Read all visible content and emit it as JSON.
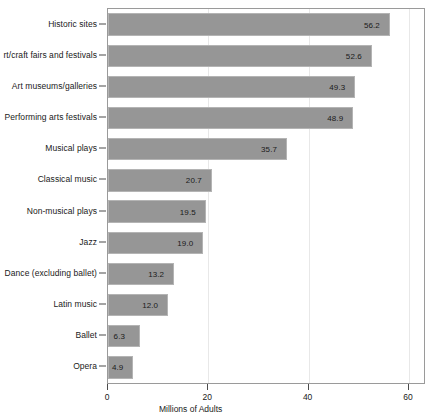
{
  "chart_data": {
    "type": "bar",
    "orientation": "horizontal",
    "title": "",
    "xlabel": "Millions of Adults",
    "ylabel": "",
    "xlim": [
      0,
      63
    ],
    "xticks": [
      0,
      20,
      40,
      60
    ],
    "grid": "vertical-faint",
    "legend": "none",
    "categories": [
      "Historic sites",
      "rt/craft fairs and festivals",
      "Art museums/galleries",
      "Performing arts festivals",
      "Musical plays",
      "Classical music",
      "Non-musical plays",
      "Jazz",
      "Dance (excluding ballet)",
      "Latin music",
      "Ballet",
      "Opera"
    ],
    "values": [
      56.2,
      52.6,
      49.3,
      48.9,
      35.7,
      20.7,
      19.5,
      19.0,
      13.2,
      12.0,
      6.3,
      4.9
    ],
    "value_labels": [
      "56.2",
      "52.6",
      "49.3",
      "48.9",
      "35.7",
      "20.7",
      "19.5",
      "19.0",
      "13.2",
      "12.0",
      "6.3",
      "4.9"
    ],
    "bar_color": "#969696",
    "bar_border_color": "#b4b4b4",
    "panel_border_color": "#9a9a9a",
    "gridline_color": "#e8e8e8",
    "text_color": "#1a1a1a"
  }
}
